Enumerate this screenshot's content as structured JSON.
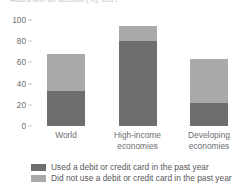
{
  "chart_data": {
    "type": "bar",
    "subtype": "stacked",
    "title": "Adults with an account (%), 2017",
    "xlabel": "",
    "ylabel": "",
    "ylim": [
      0,
      100
    ],
    "yticks": [
      0,
      20,
      40,
      60,
      80,
      100
    ],
    "grid": false,
    "legend_position": "bottom",
    "categories": [
      "World",
      "High-income economies",
      "Developing economies"
    ],
    "series": [
      {
        "name": "Used a debit or credit card in the past year",
        "color": "#6e6e70",
        "values": [
          33,
          80,
          22
        ]
      },
      {
        "name": "Did not use a debit or credit card in the past year",
        "color": "#a9a9ab",
        "values": [
          35,
          14,
          41
        ]
      }
    ],
    "totals": [
      68,
      94,
      63
    ]
  },
  "axis": {
    "ticks": [
      {
        "label": "100",
        "value": 100
      },
      {
        "label": "80",
        "value": 80
      },
      {
        "label": "60",
        "value": 60
      },
      {
        "label": "40",
        "value": 40
      },
      {
        "label": "20",
        "value": 20
      },
      {
        "label": "0",
        "value": 0
      }
    ]
  },
  "categories": [
    {
      "line1": "World",
      "line2": ""
    },
    {
      "line1": "High-income",
      "line2": "economies"
    },
    {
      "line1": "Developing",
      "line2": "economies"
    }
  ],
  "legend": [
    {
      "label": "Used a debit or credit card in the past year",
      "color": "#6e6e70"
    },
    {
      "label": "Did not use a debit or credit card in the past year",
      "color": "#a9a9ab"
    }
  ]
}
